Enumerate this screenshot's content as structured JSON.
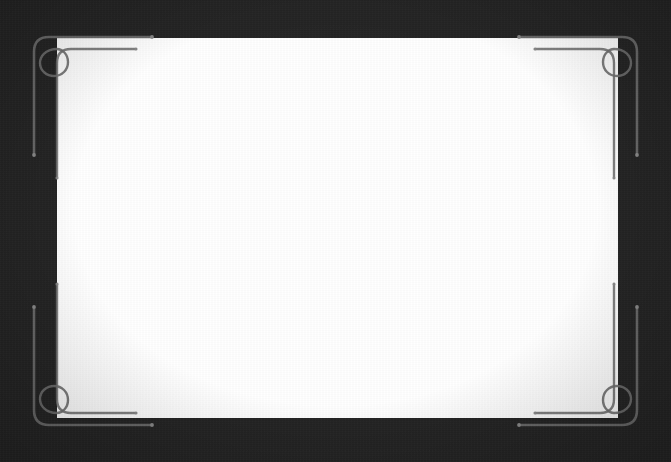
{
  "slide": {
    "background_color": "#232323",
    "panel_color": "#ffffff",
    "ornament_color": "#6e6e6e",
    "panel": {
      "label": "content-panel",
      "x": 57,
      "y": 38,
      "width": 561,
      "height": 380,
      "body_text": ""
    }
  },
  "ornament": {
    "name": "corner-flourish-frame",
    "stroke_color": "#6e6e6e",
    "stroke_width": 2,
    "corner_count": 4,
    "corners": [
      {
        "id": "top-left",
        "label": "Top left corner flourish"
      },
      {
        "id": "top-right",
        "label": "Top right corner flourish"
      },
      {
        "id": "bottom-left",
        "label": "Bottom left corner flourish"
      },
      {
        "id": "bottom-right",
        "label": "Bottom right corner flourish"
      }
    ]
  },
  "caption": {
    "text": "·····················································································"
  }
}
